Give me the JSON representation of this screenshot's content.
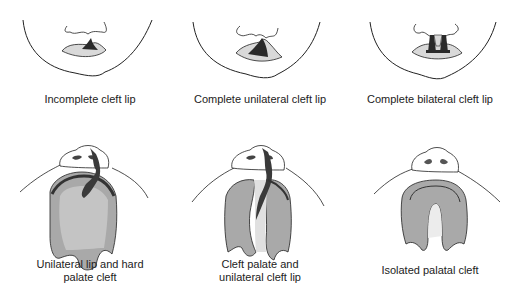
{
  "figure": {
    "colors": {
      "outline": "#222222",
      "lip_fill": "#d9d9d9",
      "palate_fill": "#a9a9a9",
      "palate_light": "#c8c8c8",
      "cleft_dark": "#3a3a3a"
    },
    "panels": [
      {
        "id": "incomplete-cleft-lip",
        "caption_lines": [
          "Incomplete cleft lip"
        ]
      },
      {
        "id": "complete-unilateral-cleft-lip",
        "caption_lines": [
          "Complete unilateral cleft lip"
        ]
      },
      {
        "id": "complete-bilateral-cleft-lip",
        "caption_lines": [
          "Complete bilateral cleft lip"
        ]
      },
      {
        "id": "unilateral-lip-hard-palate-cleft",
        "caption_lines": [
          "Unilateral lip and hard",
          "palate cleft"
        ]
      },
      {
        "id": "cleft-palate-unilateral-cleft-lip",
        "caption_lines": [
          "Cleft palate and",
          "unilateral cleft lip"
        ]
      },
      {
        "id": "isolated-palatal-cleft",
        "caption_lines": [
          "Isolated palatal cleft"
        ]
      }
    ]
  }
}
